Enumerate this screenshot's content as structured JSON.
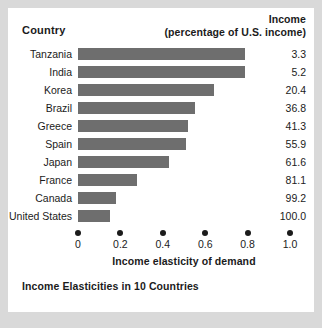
{
  "header": {
    "country_label": "Country",
    "income_label_line1": "Income",
    "income_label_line2": "(percentage of U.S. income)"
  },
  "caption": "Income Elasticities in 10 Countries",
  "colors": {
    "bar": "#6e6e6e",
    "text": "#1b1b1b",
    "card": "#ffffff",
    "page": "#d9d9d9"
  },
  "chart_data": {
    "type": "bar",
    "orientation": "horizontal",
    "title": "Income Elasticities in 10 Countries",
    "xlabel": "Income elasticity of demand",
    "ylabel": "Country",
    "xlim": [
      0,
      1.0
    ],
    "xticks": [
      "0",
      "0.2",
      "0.4",
      "0.6",
      "0.8",
      "1.0"
    ],
    "xtick_values": [
      0,
      0.2,
      0.4,
      0.6,
      0.8,
      1.0
    ],
    "grid": false,
    "legend": "none",
    "categories": [
      "Tanzania",
      "India",
      "Korea",
      "Brazil",
      "Greece",
      "Spain",
      "Japan",
      "France",
      "Canada",
      "United States"
    ],
    "values": [
      0.79,
      0.79,
      0.64,
      0.55,
      0.52,
      0.51,
      0.43,
      0.28,
      0.18,
      0.15
    ],
    "secondary_column": {
      "name": "Income (percentage of U.S. income)",
      "values": [
        "3.3",
        "5.2",
        "20.4",
        "36.8",
        "41.3",
        "55.9",
        "61.6",
        "81.1",
        "99.2",
        "100.0"
      ]
    },
    "rows": [
      {
        "country": "Tanzania",
        "elasticity": 0.79,
        "income": "3.3"
      },
      {
        "country": "India",
        "elasticity": 0.79,
        "income": "5.2"
      },
      {
        "country": "Korea",
        "elasticity": 0.64,
        "income": "20.4"
      },
      {
        "country": "Brazil",
        "elasticity": 0.55,
        "income": "36.8"
      },
      {
        "country": "Greece",
        "elasticity": 0.52,
        "income": "41.3"
      },
      {
        "country": "Spain",
        "elasticity": 0.51,
        "income": "55.9"
      },
      {
        "country": "Japan",
        "elasticity": 0.43,
        "income": "61.6"
      },
      {
        "country": "France",
        "elasticity": 0.28,
        "income": "81.1"
      },
      {
        "country": "Canada",
        "elasticity": 0.18,
        "income": "99.2"
      },
      {
        "country": "United States",
        "elasticity": 0.15,
        "income": "100.0"
      }
    ]
  }
}
